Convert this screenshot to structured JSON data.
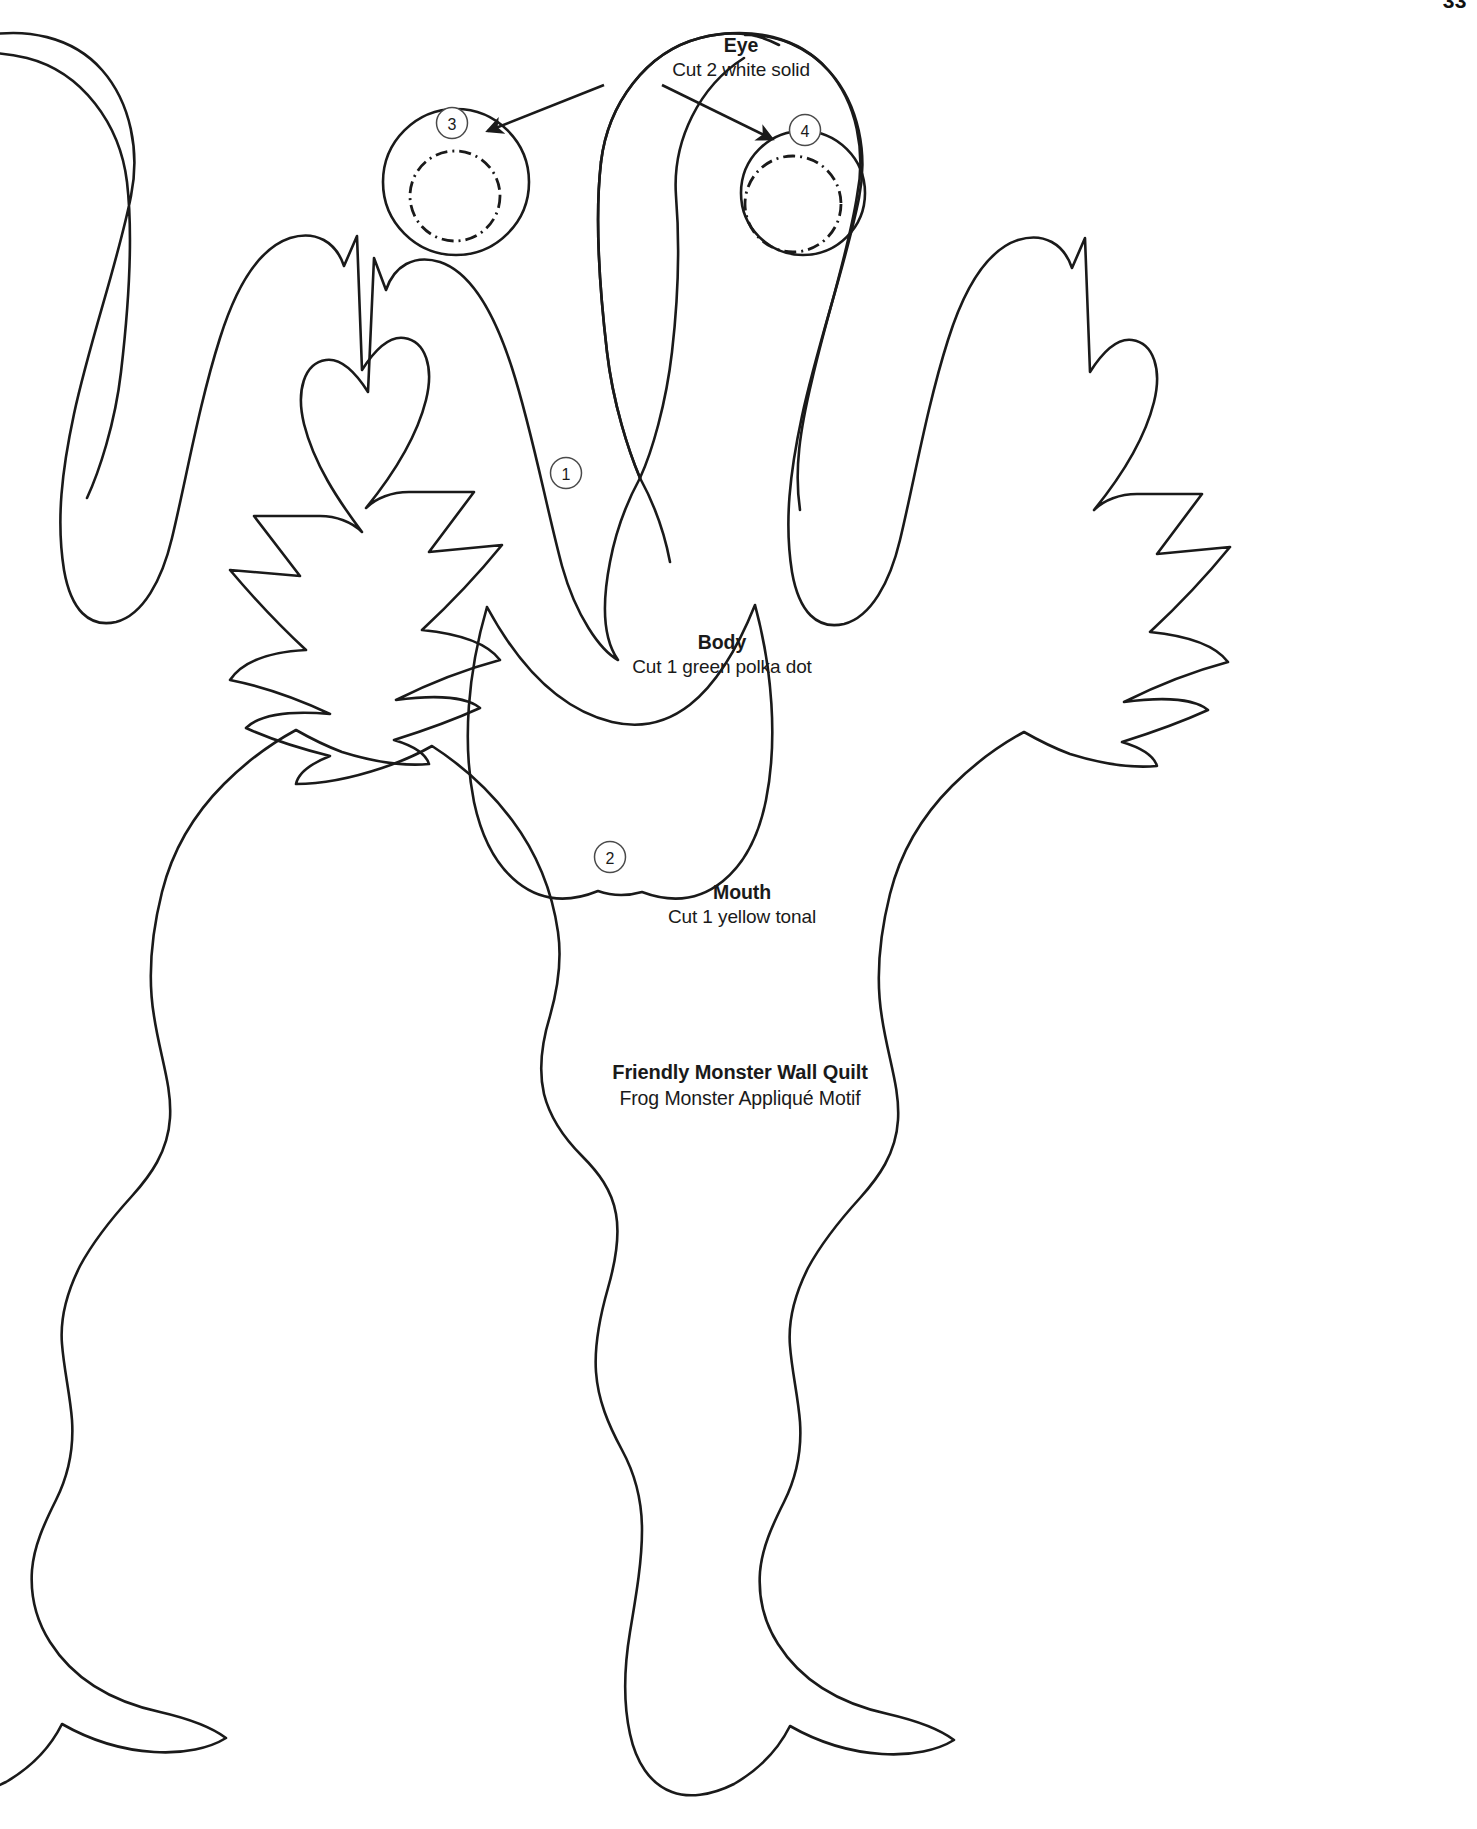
{
  "page": {
    "kind": "appliqué pattern template sheet",
    "page_number": "33",
    "background_color": "#ffffff",
    "line_color": "#1a1a1a"
  },
  "title_block": {
    "title": "Friendly Monster Wall Quilt",
    "subtitle": "Frog Monster Appliqué Motif"
  },
  "pieces": [
    {
      "id": "eye",
      "name": "Eye",
      "cut_instruction": "Cut 2 white solid",
      "marker_numbers": [
        "3",
        "4"
      ]
    },
    {
      "id": "body",
      "name": "Body",
      "cut_instruction": "Cut 1 green polka dot",
      "marker_numbers": [
        "1"
      ]
    },
    {
      "id": "mouth",
      "name": "Mouth",
      "cut_instruction": "Cut 1 yellow tonal",
      "marker_numbers": [
        "2"
      ]
    }
  ],
  "markers": {
    "body": "1",
    "mouth": "2",
    "eye_left": "3",
    "eye_right": "4"
  },
  "annotations": {
    "arrow_left_target": "left eye circle",
    "arrow_right_target": "right eye circle"
  }
}
